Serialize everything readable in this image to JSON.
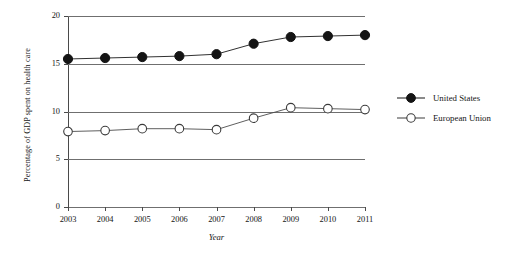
{
  "chart_data": {
    "type": "line",
    "title": "",
    "xlabel": "Year",
    "ylabel": "Percentage of GDP spent on health care",
    "categories": [
      "2003",
      "2004",
      "2005",
      "2006",
      "2007",
      "2008",
      "2009",
      "2010",
      "2011"
    ],
    "x": [
      2003,
      2004,
      2005,
      2006,
      2007,
      2008,
      2009,
      2010,
      2011
    ],
    "xlim": [
      2003,
      2011
    ],
    "ylim": [
      0,
      20
    ],
    "yticks": [
      0,
      5,
      10,
      15,
      20
    ],
    "ytick_labels": [
      "0",
      "5",
      "10",
      "15",
      "20"
    ],
    "grid": "horizontal",
    "legend_position": "right",
    "series": [
      {
        "name": "United States",
        "marker": "filled-circle",
        "color": "#1a1a1a",
        "values": [
          15.5,
          15.6,
          15.7,
          15.8,
          16.0,
          17.1,
          17.8,
          17.9,
          18.0
        ]
      },
      {
        "name": "European Union",
        "marker": "open-circle",
        "color": "#4d4d4d",
        "values": [
          7.9,
          8.0,
          8.2,
          8.2,
          8.1,
          9.3,
          10.4,
          10.3,
          10.2
        ]
      }
    ]
  },
  "axes": {
    "y_label": "Percentage of GDP spent on health care",
    "x_label": "Year"
  },
  "legend": {
    "entries": [
      {
        "label": "United States",
        "marker": "filled-circle"
      },
      {
        "label": "European Union",
        "marker": "open-circle"
      }
    ]
  },
  "colors": {
    "series_us": "#1a1a1a",
    "series_eu": "#4d4d4d",
    "gridline": "#6f6f6f",
    "axis": "#4a4a4a",
    "background": "#ffffff"
  }
}
